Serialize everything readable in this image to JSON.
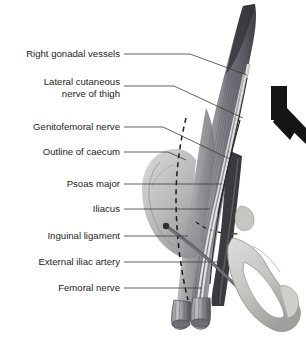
{
  "figure": {
    "background_color": "#ffffff",
    "text_color": "#231f20",
    "leader_color": "#3a3a3a",
    "labels": [
      {
        "id": "right-gonadal-vessels",
        "text": "Right gonadal vessels",
        "lines": [
          "Right gonadal vessels"
        ],
        "text_x": 120,
        "text_y": 57,
        "leader": "M124,54 L190,54 L247,75"
      },
      {
        "id": "lateral-cutaneous-nerve-of-thigh",
        "text": "Lateral cutaneous nerve of thigh",
        "lines": [
          "Lateral cutaneous",
          "nerve of thigh"
        ],
        "text_x": 120,
        "text_y": 89,
        "leader": "M124,86 L174,86 L243,118"
      },
      {
        "id": "genitofemoral-nerve",
        "text": "Genitofemoral nerve",
        "lines": [
          "Genitofemoral nerve"
        ],
        "text_x": 120,
        "text_y": 130,
        "leader": "M124,127 L163,127 L232,160"
      },
      {
        "id": "outline-of-caecum",
        "text": "Outline of caecum",
        "lines": [
          "Outline of caecum"
        ],
        "text_x": 120,
        "text_y": 155,
        "leader": "M124,152 L168,152 L186,160"
      },
      {
        "id": "psoas-major",
        "text": "Psoas major",
        "lines": [
          "Psoas major"
        ],
        "text_x": 120,
        "text_y": 187,
        "leader": "M124,184 L222,184"
      },
      {
        "id": "iliacus",
        "text": "Iliacus",
        "lines": [
          "Iliacus"
        ],
        "text_x": 120,
        "text_y": 212,
        "leader": "M124,209 L210,209"
      },
      {
        "id": "inguinal-ligament",
        "text": "Inguinal ligament",
        "lines": [
          "Inguinal ligament"
        ],
        "text_x": 120,
        "text_y": 239,
        "leader": "M124,236 L188,236"
      },
      {
        "id": "external-iliac-artery",
        "text": "External iliac artery",
        "lines": [
          "External iliac artery"
        ],
        "text_x": 120,
        "text_y": 265,
        "leader": "M124,262 L222,262"
      },
      {
        "id": "femoral-nerve",
        "text": "Femoral nerve",
        "lines": [
          "Femoral nerve"
        ],
        "text_x": 120,
        "text_y": 291,
        "leader": "M124,288 L202,288"
      }
    ],
    "structures": {
      "psoas_major": "large tapering muscle running from upper right down to lower centre",
      "iliacus": "fan-shaped muscle over the iliac fossa",
      "caecum_outline": "dashed curved line over the rounded mass",
      "pelvic_bone": "pale grey hip bone with obturator foramen at lower right",
      "dark_vessel_marker": "dark Y-shaped arrow at upper right edge",
      "cut_muscle_ends": "two striated cut bundle ends at the bottom"
    },
    "colors": {
      "muscle_dark": "#53535a",
      "muscle_mid": "#8a8a90",
      "muscle_light": "#b9b9bd",
      "bone": "#c9c9c4",
      "bone_shadow": "#a6a6a2",
      "artery_dark": "#3b3b40",
      "arrow_black": "#151515"
    }
  }
}
